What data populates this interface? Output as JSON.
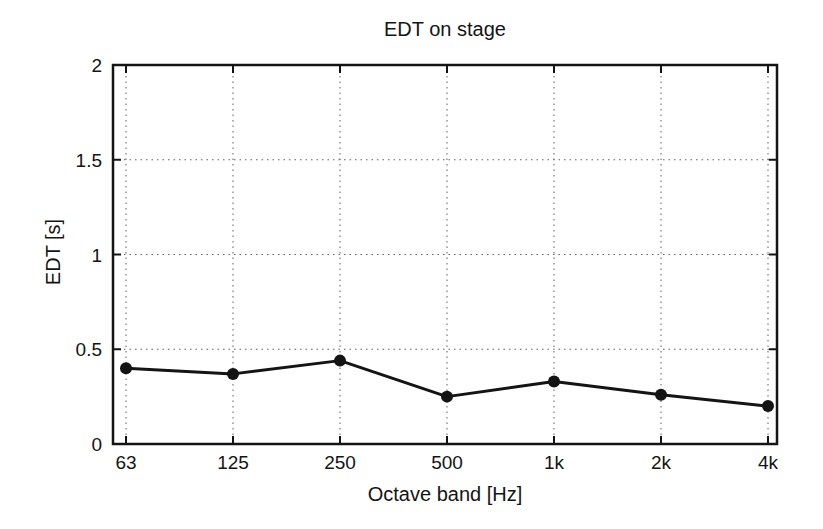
{
  "chart_data": {
    "type": "line",
    "title": "EDT on stage",
    "xlabel": "Octave band [Hz]",
    "ylabel": "EDT [s]",
    "categories": [
      "63",
      "125",
      "250",
      "500",
      "1k",
      "2k",
      "4k"
    ],
    "values": [
      0.4,
      0.37,
      0.44,
      0.25,
      0.33,
      0.26,
      0.2
    ],
    "series_name": "EDT",
    "ylim": [
      0,
      2
    ],
    "yticks": [
      0,
      0.5,
      1,
      1.5,
      2
    ],
    "ytick_labels": [
      "0",
      "0.5",
      "1",
      "1.5",
      "2"
    ],
    "grid": "dotted",
    "legend": "none",
    "marker": "filled-circle",
    "colors": {
      "background": "#ffffff",
      "line": "#141414",
      "marker": "#141414",
      "grid": "#5f5f5f",
      "text": "#141414"
    }
  }
}
